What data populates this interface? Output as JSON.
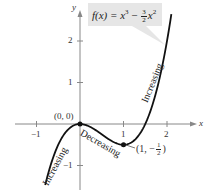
{
  "chart_data": {
    "type": "line",
    "title": "",
    "function_label": "f(x) = x^3 - (3/2)x^2",
    "xlabel": "x",
    "ylabel": "y",
    "xlim": [
      -1.3,
      2.5
    ],
    "ylim": [
      -1.7,
      2.9
    ],
    "x_ticks": [
      -1,
      1,
      2
    ],
    "x_tick_labels": [
      "−1",
      "1",
      "2"
    ],
    "y_ticks": [
      -1,
      1,
      2
    ],
    "y_tick_labels": [
      "−1",
      "1",
      "2"
    ],
    "grid": false,
    "legend": "none",
    "series": [
      {
        "name": "f(x) = x^3 - 1.5x^2",
        "x": [
          -0.8,
          -0.5,
          0,
          0.5,
          1,
          1.5,
          2,
          2.1
        ],
        "y": [
          -1.472,
          -0.5,
          0,
          -0.25,
          -0.5,
          0,
          2,
          2.646
        ]
      }
    ],
    "points": [
      {
        "x": 0,
        "y": 0,
        "label": "(0, 0)"
      },
      {
        "x": 1,
        "y": -0.5,
        "label": "(1, −1/2)"
      }
    ],
    "annotations": [
      {
        "text": "Increasing",
        "region": "x < 0"
      },
      {
        "text": "Decreasing",
        "region": "0 < x < 1"
      },
      {
        "text": "Increasing",
        "region": "x > 1"
      }
    ]
  },
  "labels": {
    "x_axis": "x",
    "y_axis": "y",
    "f_prefix": "f(x) = x",
    "f_exp": "3",
    "f_minus": " − ",
    "f_num": "3",
    "f_den": "2",
    "f_x": "x",
    "f_exp2": "2",
    "origin_point": "(0, 0)",
    "min_point_prefix": "(1, −",
    "min_num": "1",
    "min_den": "2",
    "min_suffix": ")",
    "tick_neg1_x": "−1",
    "tick_1_x": "1",
    "tick_2_x": "2",
    "tick_neg1_y": "−1",
    "tick_1_y": "1",
    "tick_2_y": "2",
    "increasing_left": "Increasing",
    "decreasing": "Decreasing",
    "increasing_right": "Increasing"
  }
}
